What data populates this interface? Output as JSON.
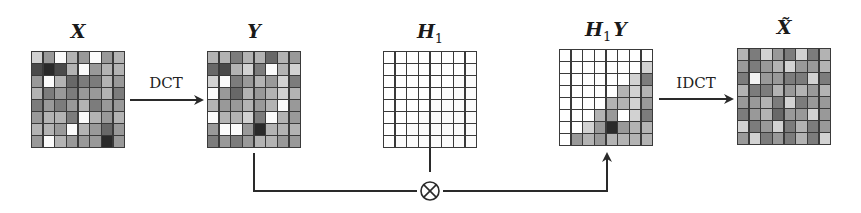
{
  "diagram": {
    "nodes": [
      {
        "id": "X",
        "label": "X",
        "subscript": "",
        "accent": "",
        "x": 31,
        "y": 51
      },
      {
        "id": "Y",
        "label": "Y",
        "subscript": "",
        "accent": "",
        "x": 207,
        "y": 51
      },
      {
        "id": "H1",
        "label": "H",
        "subscript": "1",
        "accent": "",
        "x": 383,
        "y": 51
      },
      {
        "id": "H1Y",
        "label": "H",
        "subscript": "1",
        "suffix": "Y",
        "accent": "",
        "x": 559,
        "y": 49
      },
      {
        "id": "Xtilde",
        "label": "X",
        "subscript": "",
        "accent": "~",
        "x": 737,
        "y": 48
      }
    ],
    "edges": [
      {
        "from": "X",
        "to": "Y",
        "label": "DCT"
      },
      {
        "from": "H1Y",
        "to": "Xtilde",
        "label": "IDCT"
      },
      {
        "from": "Y",
        "to": "multiply",
        "label": ""
      },
      {
        "from": "H1",
        "to": "multiply",
        "label": ""
      },
      {
        "from": "multiply",
        "to": "H1Y",
        "label": ""
      }
    ],
    "operator": {
      "symbol": "⊗",
      "name": "element-wise product"
    },
    "labels": {
      "x": "X",
      "y": "Y",
      "h": "H",
      "h_sub": "1",
      "hy_h": "H",
      "hy_sub": "1",
      "hy_y": "Y",
      "xt": "X̃",
      "dct": "DCT",
      "idct": "IDCT",
      "mult": "⊗"
    },
    "grids": {
      "X": [
        [
          8,
          6,
          1,
          7,
          6,
          1,
          6,
          7
        ],
        [
          3,
          2,
          3,
          7,
          1,
          6,
          7,
          7
        ],
        [
          6,
          1,
          7,
          4,
          5,
          5,
          7,
          6
        ],
        [
          7,
          5,
          6,
          5,
          6,
          6,
          7,
          5
        ],
        [
          5,
          6,
          5,
          6,
          7,
          5,
          6,
          6
        ],
        [
          6,
          7,
          7,
          5,
          1,
          7,
          6,
          7
        ],
        [
          7,
          7,
          6,
          1,
          7,
          6,
          4,
          6
        ],
        [
          6,
          1,
          7,
          6,
          6,
          6,
          2,
          6
        ]
      ],
      "Y": [
        [
          7,
          7,
          5,
          7,
          7,
          4,
          7,
          6
        ],
        [
          4,
          3,
          7,
          8,
          5,
          1,
          7,
          8
        ],
        [
          8,
          1,
          5,
          6,
          7,
          6,
          8,
          5
        ],
        [
          1,
          6,
          4,
          7,
          6,
          7,
          8,
          7
        ],
        [
          7,
          6,
          6,
          7,
          6,
          7,
          1,
          6
        ],
        [
          1,
          7,
          7,
          8,
          5,
          1,
          7,
          6
        ],
        [
          6,
          1,
          1,
          6,
          2,
          7,
          7,
          7
        ],
        [
          5,
          6,
          5,
          6,
          7,
          7,
          6,
          6
        ]
      ],
      "H1": [
        [
          0,
          0,
          0,
          0,
          0,
          0,
          0,
          0
        ],
        [
          0,
          0,
          0,
          0,
          0,
          0,
          0,
          1
        ],
        [
          0,
          0,
          0,
          0,
          0,
          0,
          1,
          1
        ],
        [
          0,
          0,
          0,
          0,
          0,
          1,
          1,
          1
        ],
        [
          0,
          0,
          0,
          0,
          1,
          1,
          1,
          1
        ],
        [
          0,
          0,
          0,
          1,
          1,
          1,
          1,
          1
        ],
        [
          0,
          0,
          1,
          1,
          1,
          1,
          1,
          1
        ],
        [
          0,
          1,
          1,
          1,
          1,
          1,
          1,
          1
        ]
      ],
      "H1Y": [
        [
          0,
          0,
          0,
          0,
          0,
          0,
          0,
          0
        ],
        [
          0,
          0,
          0,
          0,
          0,
          0,
          0,
          8
        ],
        [
          0,
          0,
          0,
          0,
          0,
          0,
          8,
          5
        ],
        [
          0,
          0,
          0,
          0,
          0,
          7,
          8,
          7
        ],
        [
          0,
          0,
          0,
          0,
          7,
          7,
          8,
          6
        ],
        [
          0,
          0,
          0,
          7,
          6,
          0,
          8,
          5
        ],
        [
          0,
          0,
          8,
          6,
          2,
          6,
          7,
          7
        ],
        [
          0,
          6,
          7,
          6,
          7,
          7,
          7,
          7
        ]
      ],
      "Xtilde": [
        [
          7,
          5,
          8,
          6,
          5,
          8,
          5,
          7
        ],
        [
          6,
          5,
          6,
          7,
          8,
          6,
          6,
          7
        ],
        [
          5,
          9,
          6,
          6,
          5,
          5,
          8,
          5
        ],
        [
          7,
          5,
          5,
          7,
          6,
          7,
          6,
          7
        ],
        [
          6,
          6,
          7,
          5,
          8,
          5,
          6,
          6
        ],
        [
          5,
          6,
          7,
          4,
          6,
          6,
          8,
          6
        ],
        [
          8,
          5,
          6,
          8,
          5,
          7,
          5,
          6
        ],
        [
          6,
          8,
          5,
          6,
          5,
          7,
          5,
          8
        ]
      ]
    },
    "shade_palette": {
      "0": "#ffffff",
      "1": "#fbfbfb",
      "2": "#2a2a2a",
      "3": "#4a4a4a",
      "4": "#686868",
      "5": "#7c7c7c",
      "6": "#999999",
      "7": "#b3b3b3",
      "8": "#d2d2d2",
      "9": "#f2f2f2"
    },
    "line_color": "#2a2a2a"
  }
}
